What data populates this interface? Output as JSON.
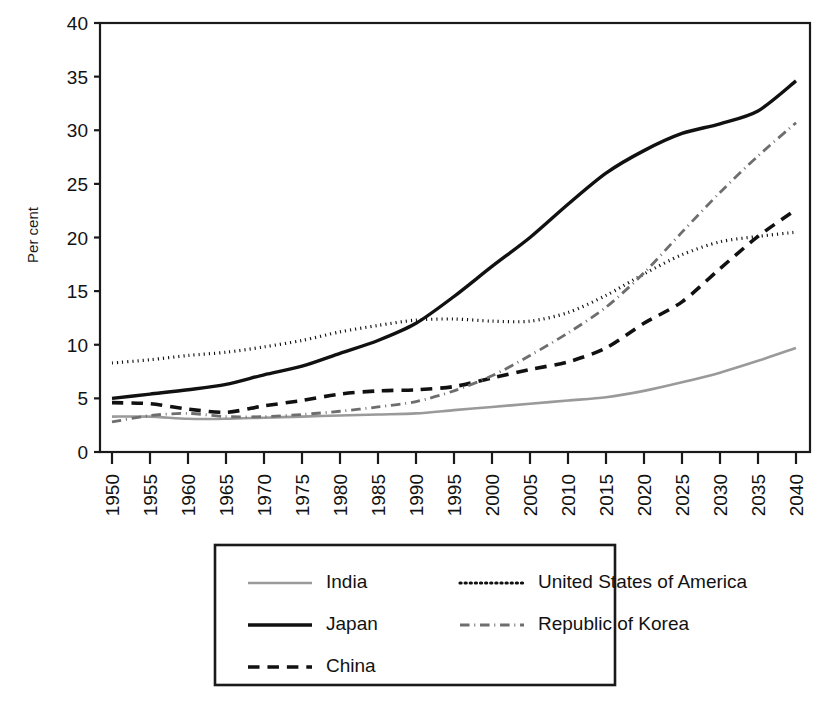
{
  "chart_data": {
    "type": "line",
    "title": "",
    "xlabel": "",
    "ylabel": "Per cent",
    "xlim": [
      1950,
      2040
    ],
    "ylim": [
      0,
      40
    ],
    "ytick_step": 5,
    "xtick_step": 5,
    "grid": false,
    "legend_position": "bottom",
    "x": [
      1950,
      1955,
      1960,
      1965,
      1970,
      1975,
      1980,
      1985,
      1990,
      1995,
      2000,
      2005,
      2010,
      2015,
      2020,
      2025,
      2030,
      2035,
      2040
    ],
    "xtick_labels": [
      "1950",
      "1955",
      "1960",
      "1965",
      "1970",
      "1975",
      "1980",
      "1985",
      "1990",
      "1995",
      "2000",
      "2005",
      "2010",
      "2015",
      "2020",
      "2025",
      "2030",
      "2035",
      "2040"
    ],
    "ytick_labels": [
      "0",
      "5",
      "10",
      "15",
      "20",
      "25",
      "30",
      "35",
      "40"
    ],
    "ytick_values": [
      0,
      5,
      10,
      15,
      20,
      25,
      30,
      35,
      40
    ],
    "series": [
      {
        "name": "India",
        "style": "solid",
        "color": "#9a9a9a",
        "width": 2.6,
        "values": [
          3.3,
          3.3,
          3.1,
          3.1,
          3.2,
          3.3,
          3.4,
          3.5,
          3.6,
          3.9,
          4.2,
          4.5,
          4.8,
          5.1,
          5.7,
          6.5,
          7.4,
          8.5,
          9.7
        ]
      },
      {
        "name": "Japan",
        "style": "solid",
        "color": "#111111",
        "width": 3.4,
        "values": [
          5.0,
          5.4,
          5.8,
          6.3,
          7.2,
          8.0,
          9.2,
          10.4,
          12.0,
          14.5,
          17.3,
          20.0,
          23.1,
          26.0,
          28.1,
          29.7,
          30.6,
          31.8,
          34.6
        ]
      },
      {
        "name": "China",
        "style": "dashed",
        "color": "#111111",
        "width": 3.6,
        "values": [
          4.6,
          4.5,
          4.0,
          3.7,
          4.3,
          4.8,
          5.4,
          5.7,
          5.8,
          6.1,
          6.9,
          7.7,
          8.4,
          9.7,
          12.0,
          14.0,
          17.1,
          20.1,
          22.6
        ]
      },
      {
        "name": "United States of America",
        "style": "dotted",
        "color": "#111111",
        "width": 3.2,
        "values": [
          8.3,
          8.6,
          9.0,
          9.3,
          9.8,
          10.4,
          11.2,
          11.8,
          12.3,
          12.4,
          12.2,
          12.2,
          13.0,
          14.6,
          16.6,
          18.4,
          19.6,
          20.1,
          20.5
        ]
      },
      {
        "name": "Republic of Korea",
        "style": "dashdot",
        "color": "#6e6e6e",
        "width": 2.8,
        "values": [
          2.8,
          3.4,
          3.6,
          3.3,
          3.3,
          3.5,
          3.8,
          4.2,
          4.7,
          5.7,
          7.1,
          9.0,
          11.1,
          13.5,
          16.7,
          20.5,
          24.2,
          27.6,
          30.7
        ]
      }
    ]
  },
  "axis": {
    "ylabel": "Per cent"
  },
  "legend": {
    "entries": [
      {
        "label": "India",
        "style": "solid",
        "color": "#9a9a9a"
      },
      {
        "label": "United States of America",
        "style": "dotted",
        "color": "#111111"
      },
      {
        "label": "Japan",
        "style": "solid",
        "color": "#111111"
      },
      {
        "label": "Republic of Korea",
        "style": "dashdot",
        "color": "#6e6e6e"
      },
      {
        "label": "China",
        "style": "dashed",
        "color": "#111111"
      }
    ]
  }
}
